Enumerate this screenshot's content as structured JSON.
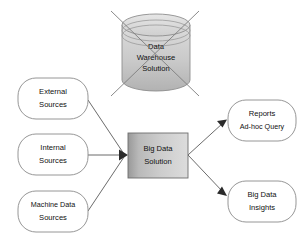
{
  "diagram": {
    "background_color": "#ffffff",
    "line_color": "#5a5a5a",
    "text_color": "#101010"
  },
  "deprecated_node": {
    "name": "data-warehouse-solution",
    "shape": "cylinder",
    "crossed_out": true,
    "fill_top": "#d8d8d8",
    "fill_bottom": "#b4b4b4",
    "line1": "Data",
    "line2": "Warehouse",
    "line3": "Solution"
  },
  "sources": [
    {
      "id": "external-sources",
      "line1": "External",
      "line2": "Sources"
    },
    {
      "id": "internal-sources",
      "line1": "Internal",
      "line2": "Sources"
    },
    {
      "id": "machine-data-sources",
      "line1": "Machine Data",
      "line2": "Sources"
    }
  ],
  "processor": {
    "id": "big-data-solution",
    "shape": "rectangle",
    "fill_left": "#9e9e9e",
    "fill_right": "#d6d6d6",
    "line1": "Big Data",
    "line2": "Solution"
  },
  "outputs": [
    {
      "id": "reports-adhoc-query",
      "line1": "Reports",
      "line2": "Ad-hoc Query"
    },
    {
      "id": "big-data-insights",
      "line1": "Big Data",
      "line2": "Insights"
    }
  ]
}
